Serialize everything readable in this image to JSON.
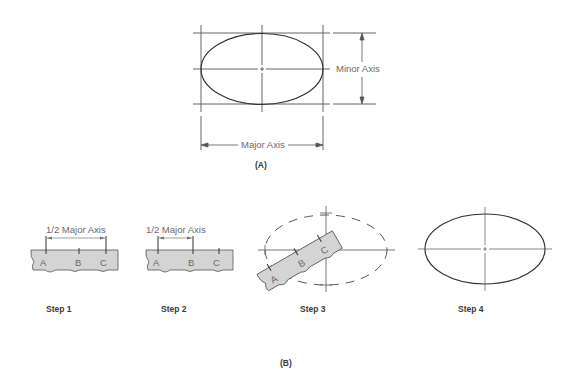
{
  "figure_a": {
    "caption": "(A)",
    "major_axis_label": "Major Axis",
    "minor_axis_label": "Minor Axis"
  },
  "figure_b": {
    "caption": "(B)",
    "steps": [
      {
        "label": "Step 1",
        "dimension_label": "1/2 Major Axis",
        "marks": [
          "A",
          "B",
          "C"
        ]
      },
      {
        "label": "Step 2",
        "dimension_label": "1/2 Major Axis",
        "marks": [
          "A",
          "B",
          "C"
        ]
      },
      {
        "label": "Step 3",
        "marks": [
          "A",
          "B",
          "C"
        ]
      },
      {
        "label": "Step 4"
      }
    ]
  },
  "colors": {
    "line": "#3a3a3a",
    "light_line": "#6a6a6a",
    "strip_fill": "#d4d4d4"
  }
}
